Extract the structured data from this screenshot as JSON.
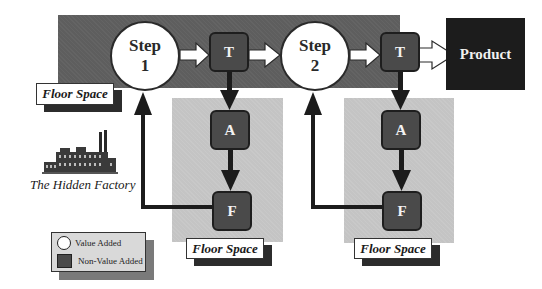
{
  "diagram": {
    "title": "The Hidden Factory",
    "steps": [
      {
        "id": "step1",
        "line1": "Step",
        "line2": "1",
        "type": "value-added"
      },
      {
        "id": "step2",
        "line1": "Step",
        "line2": "2",
        "type": "value-added"
      }
    ],
    "activities": [
      {
        "id": "T1",
        "label": "T",
        "type": "non-value-added"
      },
      {
        "id": "A1",
        "label": "A",
        "type": "non-value-added"
      },
      {
        "id": "F1",
        "label": "F",
        "type": "non-value-added"
      },
      {
        "id": "T2",
        "label": "T",
        "type": "non-value-added"
      },
      {
        "id": "A2",
        "label": "A",
        "type": "non-value-added"
      },
      {
        "id": "F2",
        "label": "F",
        "type": "non-value-added"
      }
    ],
    "product": {
      "label": "Product"
    },
    "floor_space_labels": [
      "Floor Space",
      "Floor Space",
      "Floor Space"
    ],
    "factory_caption": "The Hidden Factory",
    "flows": [
      {
        "from": "Step 1",
        "to": "T",
        "style": "hollow"
      },
      {
        "from": "T",
        "to": "Step 2",
        "style": "hollow"
      },
      {
        "from": "Step 2",
        "to": "T",
        "style": "hollow"
      },
      {
        "from": "T",
        "to": "Product",
        "style": "hollow"
      },
      {
        "from": "T",
        "to": "A",
        "style": "solid"
      },
      {
        "from": "A",
        "to": "F",
        "style": "solid"
      },
      {
        "from": "F",
        "to": "Step",
        "style": "solid-rework"
      }
    ]
  },
  "legend": {
    "items": [
      {
        "label": "Value Added",
        "shape": "circle"
      },
      {
        "label": "Non-Value Added",
        "shape": "square"
      }
    ]
  },
  "colors": {
    "main_band": "#5e5e5e",
    "floor_space": "#c4c4c4",
    "non_value_box": "#4a4a4a",
    "product_box": "#1c1c1c",
    "value_circle": "#ffffff"
  }
}
